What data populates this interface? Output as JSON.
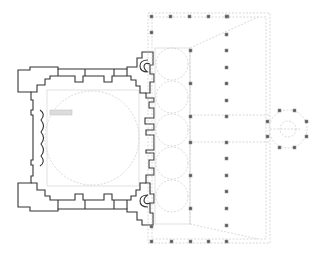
{
  "diagram": {
    "type": "architectural-floor-plan",
    "colors": {
      "background": "#ffffff",
      "walls": "#333333",
      "guide_lines": "#c8c8c8",
      "columns": "#555555"
    },
    "elements": {
      "prayer_hall": {
        "label": "prayer-hall",
        "bbox": [
          15,
          55,
          155,
          225
        ]
      },
      "courtyard": {
        "label": "courtyard-portico",
        "bbox": [
          148,
          12,
          270,
          245
        ]
      },
      "fountain": {
        "label": "octagonal-fountain",
        "center": [
          288,
          129
        ],
        "columns": 8
      },
      "courtyard_columns_count": 32
    }
  }
}
